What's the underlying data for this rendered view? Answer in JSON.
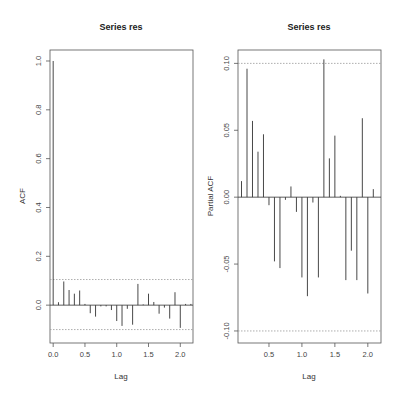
{
  "chart_data": [
    {
      "type": "bar",
      "subtype": "acf-stem",
      "title": "Series  res",
      "xlabel": "Lag",
      "ylabel": "ACF",
      "xlim": [
        -0.05,
        2.2
      ],
      "ylim": [
        -0.155,
        1.045
      ],
      "xticks": [
        0.0,
        0.5,
        1.0,
        1.5,
        2.0
      ],
      "xtick_labels": [
        "0.0",
        "0.5",
        "1.0",
        "1.5",
        "2.0"
      ],
      "yticks": [
        0.0,
        0.2,
        0.4,
        0.6,
        0.8,
        1.0
      ],
      "ytick_labels": [
        "0.0",
        "0.2",
        "0.4",
        "0.6",
        "0.8",
        "1.0"
      ],
      "ci_upper": 0.105,
      "ci_lower": -0.1,
      "grid": false,
      "lag_step": 0.0833333,
      "values": [
        1.0,
        0.012,
        0.097,
        0.062,
        0.047,
        0.06,
        0.005,
        -0.033,
        -0.047,
        -0.005,
        -0.005,
        -0.02,
        -0.065,
        -0.085,
        -0.015,
        -0.08,
        0.087,
        0.003,
        0.047,
        0.013,
        -0.035,
        -0.01,
        -0.055,
        0.053,
        -0.093,
        0.005,
        0.005
      ]
    },
    {
      "type": "bar",
      "subtype": "pacf-stem",
      "title": "Series  res",
      "xlabel": "Lag",
      "ylabel": "Partial ACF",
      "xlim": [
        0.03,
        2.2
      ],
      "ylim": [
        -0.109,
        0.11
      ],
      "xticks": [
        0.5,
        1.0,
        1.5,
        2.0
      ],
      "xtick_labels": [
        "0.5",
        "1.0",
        "1.5",
        "2.0"
      ],
      "yticks": [
        -0.1,
        -0.05,
        0.0,
        0.05,
        0.1
      ],
      "ytick_labels": [
        "-0.10",
        "-0.05",
        "0.00",
        "0.05",
        "0.10"
      ],
      "ci_upper": 0.1,
      "ci_lower": -0.1,
      "grid": false,
      "lag_step": 0.0833333,
      "values": [
        0.012,
        0.096,
        0.057,
        0.034,
        0.047,
        -0.006,
        -0.048,
        -0.053,
        -0.002,
        0.008,
        -0.011,
        -0.06,
        -0.074,
        -0.004,
        -0.06,
        0.103,
        0.029,
        0.046,
        0.001,
        -0.062,
        -0.04,
        -0.062,
        0.059,
        -0.072,
        0.006
      ]
    }
  ],
  "colors": {
    "frame": "#555555",
    "stem": "#333333",
    "ci_line": "#999999",
    "text": "#333333"
  }
}
